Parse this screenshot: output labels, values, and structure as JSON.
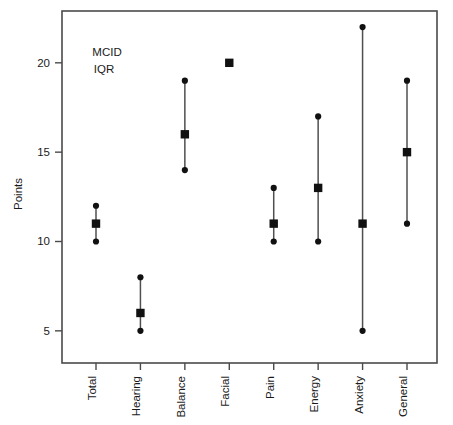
{
  "chart_data": {
    "type": "scatter",
    "title": "",
    "subtitle": "",
    "xlabel": "",
    "ylabel": "Points",
    "categories": [
      "Total",
      "Hearing",
      "Balance",
      "Facial",
      "Pain",
      "Energy",
      "Anxiety",
      "General"
    ],
    "y_ticks": [
      5,
      10,
      15,
      20
    ],
    "ylim": [
      3.2,
      22.9
    ],
    "grid": false,
    "legend_position": "top-left-inside",
    "legend_entries": [
      {
        "label": "MCID",
        "marker": "filled-square"
      },
      {
        "label": "IQR",
        "marker": "line-with-dots"
      }
    ],
    "series": [
      {
        "name": "MCID",
        "marker": "filled-square",
        "values": [
          11,
          6,
          16,
          20,
          11,
          13,
          11,
          15
        ]
      },
      {
        "name": "IQR",
        "marker": "whisker",
        "lower": [
          10,
          5,
          14,
          null,
          10,
          10,
          5,
          11
        ],
        "upper": [
          12,
          8,
          19,
          null,
          13,
          17,
          22,
          19
        ]
      }
    ],
    "points": [
      {
        "category": "Total",
        "mcid": 11,
        "iqr_low": 10,
        "iqr_high": 12
      },
      {
        "category": "Hearing",
        "mcid": 6,
        "iqr_low": 5,
        "iqr_high": 8
      },
      {
        "category": "Balance",
        "mcid": 16,
        "iqr_low": 14,
        "iqr_high": 19
      },
      {
        "category": "Facial",
        "mcid": 20,
        "iqr_low": null,
        "iqr_high": null
      },
      {
        "category": "Pain",
        "mcid": 11,
        "iqr_low": 10,
        "iqr_high": 13
      },
      {
        "category": "Energy",
        "mcid": 13,
        "iqr_low": 10,
        "iqr_high": 17
      },
      {
        "category": "Anxiety",
        "mcid": 11,
        "iqr_low": 5,
        "iqr_high": 22
      },
      {
        "category": "General",
        "mcid": 15,
        "iqr_low": 11,
        "iqr_high": 19
      }
    ],
    "colors": {
      "marker": "#111111",
      "whisker": "#4f4f4f",
      "axis": "#4a4a4a",
      "text": "#1a1a1a",
      "background": "#ffffff"
    }
  },
  "axis": {
    "y_title": "Points",
    "y_tick_labels": [
      "5",
      "10",
      "15",
      "20"
    ],
    "x_tick_labels": [
      "Total",
      "Hearing",
      "Balance",
      "Facial",
      "Pain",
      "Energy",
      "Anxiety",
      "General"
    ]
  },
  "legend": {
    "mcid_label": "MCID",
    "iqr_label": "IQR"
  }
}
